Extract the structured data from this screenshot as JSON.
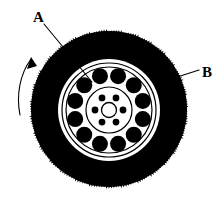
{
  "figure": {
    "background_color": "#ffffff",
    "ink_color": "#000000",
    "width": 223,
    "height": 204
  },
  "labels": [
    {
      "id": "label-a",
      "text": "A",
      "x": 33,
      "y": 22,
      "points_to": "wheel-rim",
      "leader_from": [
        44,
        24
      ],
      "leader_to": [
        92,
        82
      ]
    },
    {
      "id": "label-b",
      "text": "B",
      "x": 202,
      "y": 77,
      "points_to": "tire-tread",
      "leader_from": [
        199,
        70
      ],
      "leader_to": [
        168,
        80
      ]
    }
  ],
  "annotations": {
    "rotation_arrow": {
      "name": "rotation-direction-arrow",
      "direction": "counterclockwise-upward",
      "start": [
        20,
        113
      ],
      "end": [
        32,
        57
      ]
    }
  },
  "parts": {
    "tire": {
      "name": "tire",
      "center_x": 109,
      "center_y": 109,
      "outer_radius": 78,
      "fill": "#000000",
      "tread_texture": "serrated"
    },
    "rim": {
      "name": "wheel-rim",
      "center_x": 109,
      "center_y": 110,
      "outer_radius": 51,
      "fill": "#ffffff",
      "ring_radii": [
        51,
        47,
        43
      ],
      "inner_disc_radius": 23
    },
    "vent_holes": {
      "name": "vent-holes",
      "count": 12,
      "orbit_radius": 35,
      "hole_radius": 8,
      "fill": "#000000"
    },
    "lug_bolts": {
      "name": "lug-bolt-holes",
      "count": 6,
      "orbit_radius": 14,
      "hole_radius": 3.4,
      "fill": "#000000"
    },
    "hub": {
      "name": "hub-center",
      "radius": 7.5,
      "fill": "#ffffff",
      "stroke": "#000000"
    }
  }
}
